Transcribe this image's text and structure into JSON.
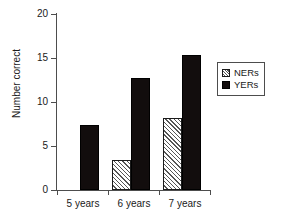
{
  "chart_data": {
    "type": "bar",
    "title": "",
    "xlabel": "",
    "ylabel": "Number correct",
    "categories": [
      "5 years",
      "6 years",
      "7 years"
    ],
    "series": [
      {
        "name": "NERs",
        "values": [
          0,
          3.4,
          8.2
        ],
        "style": "hatched-white",
        "color": "#ffffff"
      },
      {
        "name": "YERs",
        "values": [
          7.4,
          12.7,
          15.3
        ],
        "style": "solid-black",
        "color": "#120d0d"
      }
    ],
    "ylim": [
      0,
      20
    ],
    "yticks": [
      0,
      5,
      10,
      15,
      20
    ],
    "ytick_labels": [
      "0",
      "5",
      "10",
      "15",
      "20"
    ],
    "grid": false,
    "legend_position": "right"
  },
  "axes": {
    "y_title": "Number correct",
    "y_ticks": [
      {
        "value": 20,
        "label": "20"
      },
      {
        "value": 15,
        "label": "15"
      },
      {
        "value": 10,
        "label": "10"
      },
      {
        "value": 5,
        "label": "5"
      },
      {
        "value": 0,
        "label": "0"
      }
    ],
    "x_ticks": [
      {
        "label": "5 years"
      },
      {
        "label": "6 years"
      },
      {
        "label": "7 years"
      }
    ]
  },
  "legend": {
    "entries": [
      {
        "label": "NERs",
        "swatch": "hatched-swatch-icon"
      },
      {
        "label": "YERs",
        "swatch": "solid-black-swatch-icon"
      }
    ]
  }
}
